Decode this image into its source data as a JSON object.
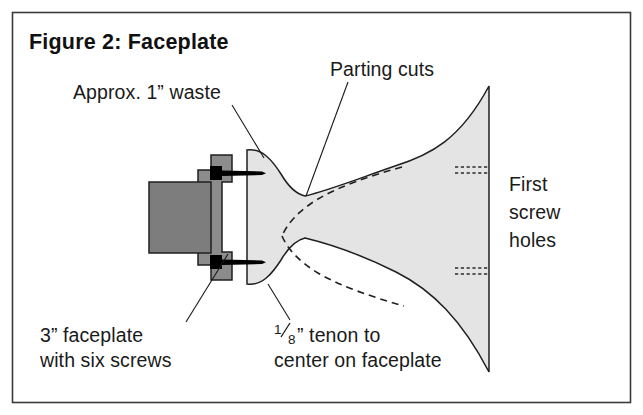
{
  "figure": {
    "title": "Figure 2: Faceplate",
    "border_color": "#3a3a3a",
    "background_color": "#ffffff"
  },
  "labels": {
    "waste": "Approx. 1” waste",
    "parting_cuts": "Parting cuts",
    "first_screw_holes_line1": "First",
    "first_screw_holes_line2": "screw",
    "first_screw_holes_line3": "holes",
    "faceplate_line1": "3” faceplate",
    "faceplate_line2": "with six screws",
    "tenon_numerator": "1",
    "tenon_denominator": "8",
    "tenon_line1_rest": "” tenon to",
    "tenon_line2": "center on faceplate"
  },
  "parts": {
    "spindle_color": "#7d7d7d",
    "faceplate_color": "#8c8c8c",
    "blank_color": "#e4e4e4",
    "screw_color": "#000000",
    "outline_color": "#1f1f1f",
    "spindle_name": "lathe-spindle",
    "faceplate_name": "faceplate-body",
    "blank_name": "bowl-blank",
    "screw_upper_name": "upper-screw",
    "screw_lower_name": "lower-screw",
    "parting_cut_name": "parting-cut-dashed-curve",
    "screw_hole_upper_name": "upper-screw-hole",
    "screw_hole_lower_name": "lower-screw-hole"
  }
}
